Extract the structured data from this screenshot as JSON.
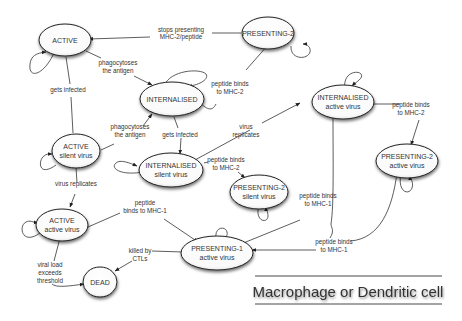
{
  "diagram": {
    "title": "Macrophage or Dendritic cell",
    "nodes": {
      "active": {
        "line1": "ACTIVE",
        "line2": ""
      },
      "presenting2": {
        "line1": "PRESENTING-2",
        "line2": ""
      },
      "internalised": {
        "line1": "INTERNALISED",
        "line2": ""
      },
      "active_silent": {
        "line1": "ACTIVE",
        "line2": "silent virus"
      },
      "internalised_silent": {
        "line1": "INTERNALISED",
        "line2": "silent virus"
      },
      "internalised_active": {
        "line1": "INTERNALISED",
        "line2": "active virus"
      },
      "presenting2_silent": {
        "line1": "PRESENTING-2",
        "line2": "silent virus"
      },
      "presenting2_active": {
        "line1": "PRESENTING-2",
        "line2": "active virus"
      },
      "active_active": {
        "line1": "ACTIVE",
        "line2": "active virus"
      },
      "presenting1_active": {
        "line1": "PRESENTING-1",
        "line2": "active virus"
      },
      "dead": {
        "line1": "DEAD",
        "line2": ""
      }
    },
    "edges": {
      "stops_presenting": {
        "line1": "stops presenting",
        "line2": "MHC-2/peptide"
      },
      "phago_1": {
        "line1": "phagocytoses",
        "line2": "the antigen"
      },
      "gets_infected_1": {
        "line1": "gets infected"
      },
      "phago_2": {
        "line1": "phagocytoses",
        "line2": "the antigen"
      },
      "gets_infected_2": {
        "line1": "gets infected"
      },
      "peptide_mhc2_1": {
        "line1": "peptide binds",
        "line2": "to MHC-2"
      },
      "virus_replicates_1": {
        "line1": "virus",
        "line2": "replicates"
      },
      "peptide_mhc2_2": {
        "line1": "peptide binds",
        "line2": "to MHC-2"
      },
      "peptide_mhc2_3": {
        "line1": "peptide binds",
        "line2": "to MHC-2"
      },
      "virus_replicates_2": {
        "line1": "virus replicates"
      },
      "peptide_mhc1_1": {
        "line1": "peptide",
        "line2": "binds to MHC-1"
      },
      "peptide_mhc1_2": {
        "line1": "peptide binds",
        "line2": "to MHC-1"
      },
      "peptide_mhc1_3": {
        "line1": "peptide binds",
        "line2": "to MHC-1"
      },
      "killed": {
        "line1": "killed by",
        "line2": "CTLs"
      },
      "viral_load": {
        "line1": "viral load",
        "line2": "exceeds",
        "line3": "threshold"
      }
    }
  }
}
